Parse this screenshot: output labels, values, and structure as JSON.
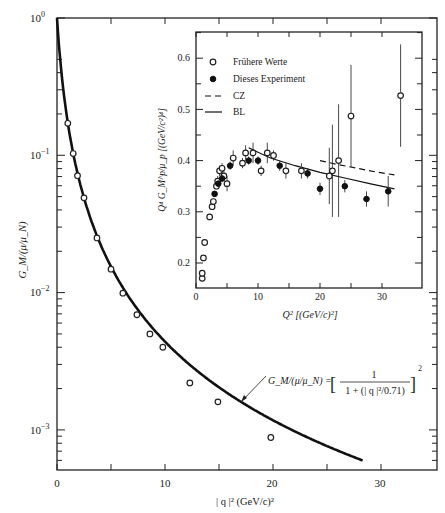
{
  "chart_data": [
    {
      "id": "main",
      "type": "scatter",
      "title": "",
      "xlabel": "|q|² (GeV/c)²",
      "ylabel": "G_M/(μ/μ_N)",
      "yscale": "log",
      "xlim": [
        0,
        35
      ],
      "ylim": [
        0.0005,
        1
      ],
      "x_ticks": [
        0,
        10,
        20,
        30
      ],
      "x_minor_ticks": [
        5,
        15,
        25
      ],
      "y_ticks": [
        "10^0",
        "10^-1",
        "10^-2",
        "10^-3"
      ],
      "y_tick_values": [
        1,
        0.1,
        0.01,
        0.001
      ],
      "grid": false,
      "series": [
        {
          "name": "Messpunkte",
          "marker": "open-circle",
          "x": [
            1.0,
            1.5,
            1.9,
            2.5,
            3.7,
            5.0,
            6.1,
            7.4,
            8.6,
            9.8,
            12.3,
            14.9,
            19.8
          ],
          "y": [
            0.171,
            0.103,
            0.071,
            0.049,
            0.025,
            0.0148,
            0.0099,
            0.0069,
            0.005,
            0.004,
            0.0022,
            0.0016,
            0.00088
          ]
        },
        {
          "name": "Dipolformel",
          "type": "line",
          "formula": "G_M/(μ/μ_N) = [1/(1+|q|²/0.71)]²",
          "x_range": [
            0,
            28.3
          ]
        }
      ],
      "annotation": {
        "lhs": "G_M/(μ/μ_N) = ",
        "numerator": "1",
        "denominator": "1 + (| q |²/0.71)",
        "exponent": "2",
        "arrow_to_x": 17.2
      }
    },
    {
      "id": "inset",
      "type": "scatter",
      "xlabel": "Q² [(GeV/c)²]",
      "ylabel": "Q⁴ G_M^p/μ_p [(GeV/c²)⁴]",
      "xlim": [
        0,
        36
      ],
      "ylim": [
        0.15,
        0.65
      ],
      "x_ticks": [
        0,
        10,
        20,
        30
      ],
      "x_minor_ticks": [
        5,
        15,
        25
      ],
      "y_ticks": [
        0.2,
        0.3,
        0.4,
        0.5,
        0.6
      ],
      "grid": false,
      "legend_position": "upper-left",
      "series": [
        {
          "name": "Frühere Werte",
          "marker": "open-circle",
          "x": [
            1.0,
            1.0,
            1.2,
            1.4,
            2.2,
            2.6,
            2.8,
            3.3,
            3.5,
            3.8,
            4.2,
            4.5,
            5.0,
            6.0,
            7.5,
            8.0,
            9.2,
            10.5,
            11.5,
            12.5,
            14.5,
            17.0,
            21.5,
            22.0,
            23.0,
            25.0,
            33.0
          ],
          "y": [
            0.17,
            0.18,
            0.21,
            0.24,
            0.29,
            0.31,
            0.32,
            0.35,
            0.36,
            0.38,
            0.385,
            0.37,
            0.355,
            0.405,
            0.395,
            0.415,
            0.415,
            0.38,
            0.415,
            0.41,
            0.38,
            0.38,
            0.37,
            0.38,
            0.4,
            0.487,
            0.527
          ],
          "err": [
            0,
            0,
            0,
            0,
            0,
            0,
            0,
            0,
            0.01,
            0.01,
            0.01,
            0.01,
            0.015,
            0.015,
            0.01,
            0.015,
            0.02,
            0.01,
            0.02,
            0.01,
            0.015,
            0.015,
            0.055,
            0.09,
            0.11,
            0.1,
            0.1
          ]
        },
        {
          "name": "Dieses Experiment",
          "marker": "filled-circle",
          "x": [
            3.0,
            3.6,
            4.2,
            5.5,
            8.5,
            10.0,
            13.5,
            18.0,
            20.0,
            24.0,
            27.5,
            31.0
          ],
          "y": [
            0.335,
            0.355,
            0.365,
            0.39,
            0.4,
            0.4,
            0.39,
            0.375,
            0.345,
            0.35,
            0.325,
            0.34
          ],
          "err": [
            0.005,
            0.005,
            0.007,
            0.008,
            0.008,
            0.008,
            0.01,
            0.01,
            0.012,
            0.012,
            0.015,
            0.03
          ]
        },
        {
          "name": "CZ",
          "type": "line",
          "style": "dashed",
          "x": [
            20,
            23,
            26,
            29,
            32
          ],
          "y": [
            0.4,
            0.392,
            0.385,
            0.378,
            0.372
          ]
        },
        {
          "name": "BL",
          "type": "line",
          "style": "solid",
          "x": [
            8.5,
            12,
            16,
            20,
            24,
            28,
            32
          ],
          "y": [
            0.425,
            0.405,
            0.39,
            0.377,
            0.366,
            0.355,
            0.345
          ]
        }
      ]
    }
  ],
  "labels": {
    "main_xlabel": "| q |² (GeV/c)²",
    "main_ylabel": "G_M/(μ/μ_N)",
    "inset_xlabel": "Q² [(GeV/c)²]",
    "inset_ylabel": "Q⁴ G_M^p/μ_p [(GeV/c²)⁴]",
    "legend": [
      "Frühere Werte",
      "Dieses Experiment",
      "CZ",
      "BL"
    ],
    "main_y_ticks": [
      "10",
      "10",
      "10",
      "10"
    ],
    "main_y_exps": [
      "0",
      "−1",
      "−2",
      "−3"
    ],
    "main_x_ticks": [
      "0",
      "10",
      "20",
      "30"
    ],
    "inset_x_ticks": [
      "0",
      "10",
      "20",
      "30"
    ],
    "inset_y_ticks": [
      "0.2",
      "0.3",
      "0.4",
      "0.5",
      "0.6"
    ],
    "formula_lhs": "G_M/(μ/μ_N) = ",
    "formula_num": "1",
    "formula_den": "1 + (| q |²/0.71)",
    "formula_exp": "2"
  }
}
